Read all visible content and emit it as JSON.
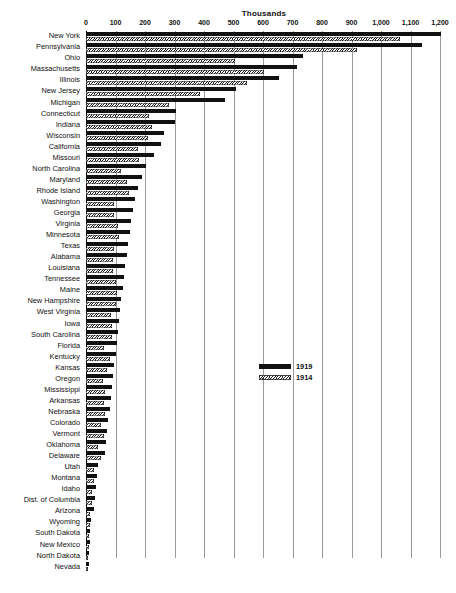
{
  "chart_data": {
    "type": "bar",
    "orientation": "horizontal",
    "title": "",
    "xlabel": "Thousands",
    "ylabel": "",
    "xlim": [
      0,
      1200
    ],
    "grid": true,
    "legend_position": "middle-right",
    "axis_ticks": [
      "0",
      "100",
      "200",
      "300",
      "400",
      "500",
      "600",
      "700",
      "800",
      "900",
      "1,000",
      "1,100",
      "1,200"
    ],
    "axis_tick_values": [
      0,
      100,
      200,
      300,
      400,
      500,
      600,
      700,
      800,
      900,
      1000,
      1100,
      1200
    ],
    "series": [
      {
        "name": "1919",
        "fill": "solid-black"
      },
      {
        "name": "1914",
        "fill": "hatched"
      }
    ],
    "categories": [
      "New York",
      "Pennsylvania",
      "Ohio",
      "Massachusetts",
      "Illinois",
      "New Jersey",
      "Michigan",
      "Connecticut",
      "Indiana",
      "Wisconsin",
      "California",
      "Missouri",
      "North Carolina",
      "Maryland",
      "Rhode Island",
      "Washington",
      "Georgia",
      "Virginia",
      "Minnesota",
      "Texas",
      "Alabama",
      "Louisiana",
      "Tennessee",
      "Maine",
      "New Hampshire",
      "West Virginia",
      "Iowa",
      "South Carolina",
      "Florida",
      "Kentucky",
      "Kansas",
      "Oregon",
      "Mississippi",
      "Arkansas",
      "Nebraska",
      "Colorado",
      "Vermont",
      "Oklahoma",
      "Delaware",
      "Utah",
      "Montana",
      "Idaho",
      "Dist. of Columbia",
      "Arizona",
      "Wyoming",
      "South Dakota",
      "New Mexico",
      "North Dakota",
      "Nevada"
    ],
    "values_1919": [
      1205,
      1140,
      735,
      715,
      655,
      510,
      470,
      305,
      300,
      265,
      255,
      230,
      205,
      190,
      175,
      165,
      160,
      152,
      148,
      142,
      138,
      133,
      130,
      124,
      120,
      116,
      112,
      108,
      104,
      100,
      96,
      92,
      88,
      84,
      80,
      76,
      72,
      68,
      64,
      42,
      38,
      34,
      30,
      26,
      18,
      15,
      13,
      11,
      9
    ],
    "values_1914": [
      1065,
      920,
      505,
      605,
      545,
      385,
      280,
      215,
      225,
      210,
      175,
      180,
      120,
      140,
      145,
      95,
      95,
      110,
      112,
      95,
      90,
      90,
      100,
      105,
      100,
      85,
      88,
      88,
      62,
      80,
      70,
      58,
      66,
      62,
      64,
      52,
      62,
      40,
      52,
      26,
      26,
      22,
      20,
      14,
      12,
      11,
      9,
      8,
      7
    ]
  },
  "legend": {
    "items": [
      {
        "label": "1919",
        "style": "solid"
      },
      {
        "label": "1914",
        "style": "hatched"
      }
    ]
  },
  "caption": {
    "text": ""
  }
}
